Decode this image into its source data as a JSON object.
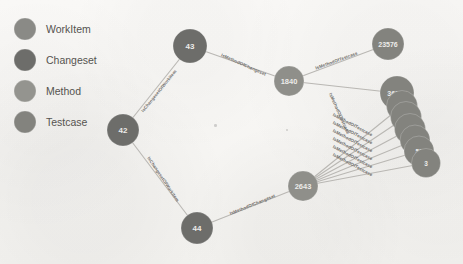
{
  "canvas": {
    "width": 463,
    "height": 264,
    "background_color": "#f7f6f4"
  },
  "legend": {
    "items": [
      {
        "label": "WorkItem",
        "color": "#8a8a86"
      },
      {
        "label": "Changeset",
        "color": "#6d6d6a"
      },
      {
        "label": "Method",
        "color": "#94948f"
      },
      {
        "label": "Testcase",
        "color": "#83837e"
      }
    ]
  },
  "chart_data": {
    "type": "diagram",
    "title": "",
    "graph_kind": "node-link",
    "node_types": [
      "WorkItem",
      "Changeset",
      "Method",
      "Testcase"
    ],
    "nodes": [
      {
        "id": "n43",
        "label": "43",
        "type": "Changeset",
        "x": 190,
        "y": 46,
        "r": 17,
        "color": "#6d6d6a",
        "font_size": 8
      },
      {
        "id": "n42",
        "label": "42",
        "type": "Changeset",
        "x": 123,
        "y": 130,
        "r": 16,
        "color": "#6d6d6a",
        "font_size": 8
      },
      {
        "id": "n44",
        "label": "44",
        "type": "Changeset",
        "x": 197,
        "y": 228,
        "r": 16,
        "color": "#6d6d6a",
        "font_size": 8
      },
      {
        "id": "n1840",
        "label": "1840",
        "type": "Method",
        "x": 289,
        "y": 81,
        "r": 15,
        "color": "#8f8f8a",
        "font_size": 7.5
      },
      {
        "id": "n2643",
        "label": "2643",
        "type": "Method",
        "x": 303,
        "y": 186,
        "r": 15,
        "color": "#8f8f8a",
        "font_size": 7.5
      },
      {
        "id": "n23576",
        "label": "23576",
        "type": "Testcase",
        "x": 388,
        "y": 44,
        "r": 16,
        "color": "#83837e",
        "font_size": 7
      },
      {
        "id": "n36143",
        "label": "36143",
        "type": "Testcase",
        "x": 397,
        "y": 93,
        "r": 17,
        "color": "#83837e",
        "font_size": 7
      },
      {
        "id": "c1",
        "label": "",
        "type": "Testcase",
        "x": 402,
        "y": 106,
        "r": 15.5,
        "color": "#83837e",
        "font_size": 6
      },
      {
        "id": "c2",
        "label": "",
        "type": "Testcase",
        "x": 406,
        "y": 117,
        "r": 15.5,
        "color": "#83837e",
        "font_size": 6
      },
      {
        "id": "c3",
        "label": "40",
        "type": "Testcase",
        "x": 410,
        "y": 129,
        "r": 15.5,
        "color": "#83837e",
        "font_size": 6.5
      },
      {
        "id": "c4",
        "label": "3",
        "type": "Testcase",
        "x": 415,
        "y": 140,
        "r": 15,
        "color": "#83837e",
        "font_size": 6.5
      },
      {
        "id": "c5",
        "label": "51",
        "type": "Testcase",
        "x": 419,
        "y": 151,
        "r": 15,
        "color": "#83837e",
        "font_size": 6.5
      },
      {
        "id": "c6",
        "label": "3",
        "type": "Testcase",
        "x": 426,
        "y": 163,
        "r": 14.5,
        "color": "#83837e",
        "font_size": 6.5
      }
    ],
    "edges": [
      {
        "source": "n42",
        "target": "n43",
        "label": "IsChangesetOfWorkitem",
        "label_x": 160,
        "label_y": 92,
        "angle": -51
      },
      {
        "source": "n42",
        "target": "n44",
        "label": "IsChangesetOfWorkitem",
        "label_x": 162,
        "label_y": 180,
        "angle": 56
      },
      {
        "source": "n43",
        "target": "n1840",
        "label": "IsMethodOfChangeset",
        "label_x": 243,
        "label_y": 66,
        "angle": 24
      },
      {
        "source": "n44",
        "target": "n2643",
        "label": "IsMethodOfChangeset",
        "label_x": 253,
        "label_y": 206,
        "angle": -22
      },
      {
        "source": "n1840",
        "target": "n23576",
        "label": "IsMethodOfTestcase",
        "label_x": 337,
        "label_y": 62,
        "angle": -20
      },
      {
        "source": "n1840",
        "target": "n36143",
        "label": "IsMethodOfTestcase",
        "label_x": 338,
        "label_y": 114,
        "angle": 66
      },
      {
        "source": "n2643",
        "target": "c1",
        "label": "IsMethodOfTestcase",
        "label_x": 352,
        "label_y": 126,
        "angle": 28
      },
      {
        "source": "n2643",
        "target": "c2",
        "label": "IsMethodOfTestcase",
        "label_x": 352,
        "label_y": 134,
        "angle": 28
      },
      {
        "source": "n2643",
        "target": "c3",
        "label": "IsMethodOfTestcase",
        "label_x": 352,
        "label_y": 142,
        "angle": 28
      },
      {
        "source": "n2643",
        "target": "c4",
        "label": "IsMethodOfTestcase",
        "label_x": 352,
        "label_y": 150,
        "angle": 28
      },
      {
        "source": "n2643",
        "target": "c5",
        "label": "IsMethodOfTestcase",
        "label_x": 352,
        "label_y": 158,
        "angle": 28
      },
      {
        "source": "n2643",
        "target": "c6",
        "label": "IsMethodOfTestcase",
        "label_x": 352,
        "label_y": 166,
        "angle": 28
      }
    ],
    "edge_color": "#b9b7b3",
    "legend_position": "top-left"
  }
}
